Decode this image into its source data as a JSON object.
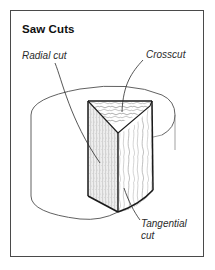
{
  "figure": {
    "title": "Saw Cuts",
    "frame_color": "#4a4a4a",
    "background_color": "#ffffff",
    "ink_color": "#1a1a1a",
    "labels": {
      "radial_cut": "Radial cut",
      "crosscut": "Crosscut",
      "tangential_cut": "Tangential cut"
    },
    "illustration": {
      "subject": "log-with-wedge-cut-away",
      "faces": [
        {
          "name": "crosscut-face",
          "texture": "growth-ring-squiggles"
        },
        {
          "name": "radial-face",
          "texture": "fine-vertical-stipple"
        },
        {
          "name": "tangential-face",
          "texture": "wavy-grain"
        }
      ]
    }
  }
}
